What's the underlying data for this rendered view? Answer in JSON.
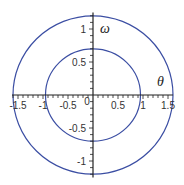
{
  "chart_data": {
    "type": "line",
    "title": "",
    "xlabel": "θ",
    "ylabel": "ω",
    "xlim": [
      -1.62,
      1.6
    ],
    "ylim": [
      -1.25,
      1.25
    ],
    "grid": false,
    "legend": "none",
    "x_ticks": [
      {
        "value": -1.5,
        "label": "-1.5"
      },
      {
        "value": -1,
        "label": "-1"
      },
      {
        "value": -0.5,
        "label": "-0.5"
      },
      {
        "value": 0,
        "label": "0"
      },
      {
        "value": 0.5,
        "label": "0.5"
      },
      {
        "value": 1,
        "label": "1"
      },
      {
        "value": 1.5,
        "label": "1.5"
      }
    ],
    "y_ticks": [
      {
        "value": 1,
        "label": "1"
      },
      {
        "value": 0.5,
        "label": "0.5"
      },
      {
        "value": -0.5,
        "label": "-0.5"
      },
      {
        "value": -1,
        "label": "-1"
      }
    ],
    "series": [
      {
        "name": "outer orbit",
        "shape": "ellipse",
        "center": [
          0,
          0
        ],
        "theta_radius": 1.6,
        "omega_radius": 1.2,
        "color": "#3b4ea3"
      },
      {
        "name": "inner orbit",
        "shape": "ellipse",
        "center": [
          0,
          0
        ],
        "theta_radius": 0.95,
        "omega_radius": 0.7,
        "color": "#3b4ea3"
      }
    ],
    "axis_color": "#222222"
  }
}
